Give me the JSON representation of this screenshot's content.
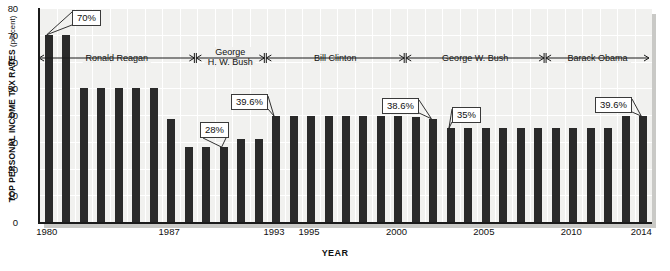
{
  "chart_data": {
    "type": "bar",
    "title": "",
    "xlabel": "YEAR",
    "ylabel": "TOP PERSONAL INCOME TAX RATES",
    "ylabel_unit": "(percent)",
    "ylim": [
      0,
      80
    ],
    "ytick_values": [
      0,
      10,
      20,
      30,
      40,
      50,
      60,
      70,
      80
    ],
    "xtick_labels": [
      "1980",
      "1987",
      "1993",
      "1995",
      "2000",
      "2005",
      "2010",
      "2014"
    ],
    "grid": true,
    "legend": "none",
    "bar_color": "#2a2a2a",
    "plot_background": "#f1f1ef",
    "categories": [
      1980,
      1981,
      1982,
      1983,
      1984,
      1985,
      1986,
      1987,
      1988,
      1989,
      1990,
      1991,
      1992,
      1993,
      1994,
      1995,
      1996,
      1997,
      1998,
      1999,
      2000,
      2001,
      2002,
      2003,
      2004,
      2005,
      2006,
      2007,
      2008,
      2009,
      2010,
      2011,
      2012,
      2013,
      2014
    ],
    "values": [
      70,
      70,
      50,
      50,
      50,
      50,
      50,
      38.5,
      28,
      28,
      28,
      31,
      31,
      39.6,
      39.6,
      39.6,
      39.6,
      39.6,
      39.6,
      39.6,
      39.6,
      39.1,
      38.6,
      35,
      35,
      35,
      35,
      35,
      35,
      35,
      35,
      35,
      35,
      39.6,
      39.6
    ],
    "annotations": [
      {
        "label": "70%",
        "year": 1980,
        "value": 70
      },
      {
        "label": "28%",
        "year": 1990,
        "value": 28
      },
      {
        "label": "39.6%",
        "year": 1993,
        "value": 39.6
      },
      {
        "label": "38.6%",
        "year": 2002,
        "value": 38.6
      },
      {
        "label": "35%",
        "year": 2003,
        "value": 35
      },
      {
        "label": "39.6%",
        "year": 2014,
        "value": 39.6
      }
    ],
    "president_spans": [
      {
        "name": "Ronald Reagan",
        "line1": "Ronald Reagan",
        "line2": "",
        "start": 1980,
        "end": 1988
      },
      {
        "name": "George H. W. Bush",
        "line1": "George",
        "line2": "H. W. Bush",
        "start": 1989,
        "end": 1992
      },
      {
        "name": "Bill Clinton",
        "line1": "Bill Clinton",
        "line2": "",
        "start": 1993,
        "end": 2000
      },
      {
        "name": "George W. Bush",
        "line1": "George W. Bush",
        "line2": "",
        "start": 2001,
        "end": 2008
      },
      {
        "name": "Barack Obama",
        "line1": "Barack Obama",
        "line2": "",
        "start": 2009,
        "end": 2014
      }
    ]
  }
}
